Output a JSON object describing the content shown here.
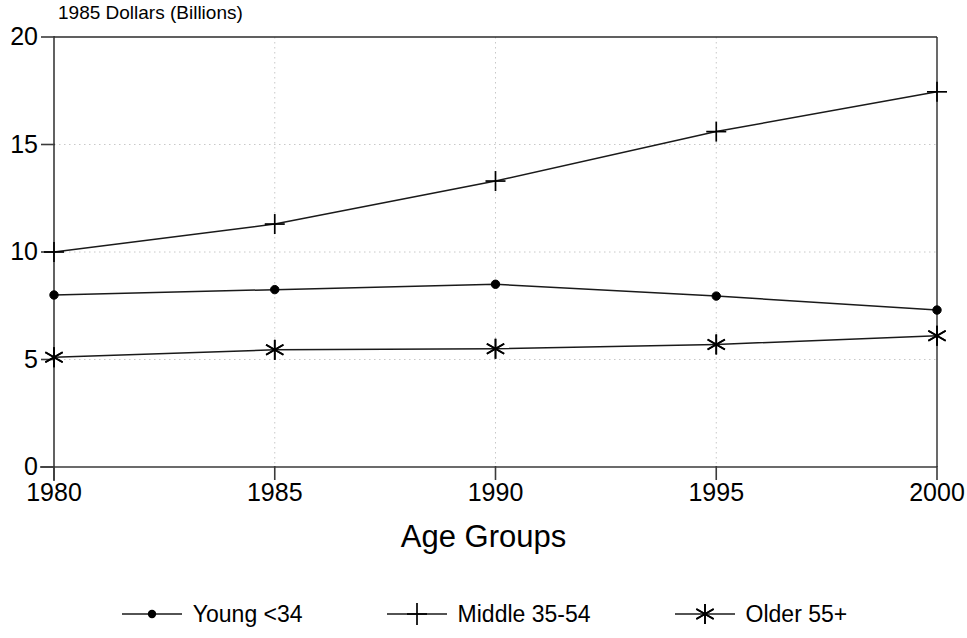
{
  "chart_data": {
    "type": "line",
    "title": "",
    "ylabel": "1985 Dollars (Billions)",
    "xlabel": "Age Groups",
    "categories": [
      "1980",
      "1985",
      "1990",
      "1995",
      "2000"
    ],
    "x": [
      1980,
      1985,
      1990,
      1995,
      2000
    ],
    "xlim": [
      1980,
      2000
    ],
    "ylim": [
      0,
      20
    ],
    "yticks": [
      "0",
      "5",
      "10",
      "15",
      "20"
    ],
    "ytick_values": [
      0,
      5,
      10,
      15,
      20
    ],
    "xticks": [
      "1980",
      "1985",
      "1990",
      "1995",
      "2000"
    ],
    "grid": true,
    "legend_position": "bottom",
    "series": [
      {
        "name": "Young <34",
        "marker": "dot",
        "color": "#000000",
        "values": [
          8.0,
          8.25,
          8.5,
          7.95,
          7.3
        ]
      },
      {
        "name": "Middle 35-54",
        "marker": "plus",
        "color": "#000000",
        "values": [
          10.0,
          11.3,
          13.3,
          15.6,
          17.45
        ]
      },
      {
        "name": "Older 55+",
        "marker": "asterisk",
        "color": "#000000",
        "values": [
          5.1,
          5.45,
          5.5,
          5.7,
          6.1
        ]
      }
    ]
  },
  "axis": {
    "y_title": "1985 Dollars (Billions)",
    "x_title": "Age Groups"
  },
  "legend": {
    "items": [
      {
        "label": "Young <34",
        "marker": "dot-marker-icon"
      },
      {
        "label": "Middle 35-54",
        "marker": "plus-marker-icon"
      },
      {
        "label": "Older 55+",
        "marker": "asterisk-marker-icon"
      }
    ]
  }
}
